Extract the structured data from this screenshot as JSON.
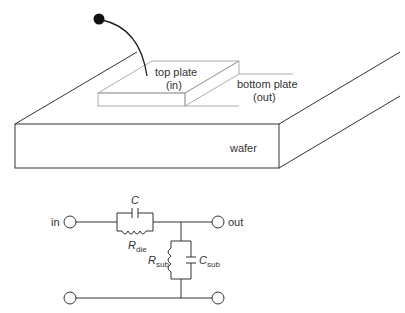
{
  "illustration": {
    "labels": {
      "top_plate": "top plate",
      "top_plate_sub": "(in)",
      "bottom_plate": "bottom plate",
      "bottom_plate_sub": "(out)",
      "wafer": "wafer"
    }
  },
  "circuit": {
    "terminals": {
      "in": "in",
      "out": "out"
    },
    "components": {
      "C": "C",
      "R_die_main": "R",
      "R_die_sub": "die",
      "R_sub_main": "R",
      "R_sub_sub": "sub",
      "C_sub_main": "C",
      "C_sub_sub": "sub"
    }
  },
  "colors": {
    "stroke": "#333333",
    "light_stroke": "#999999",
    "text": "#333333",
    "background": "#ffffff"
  }
}
